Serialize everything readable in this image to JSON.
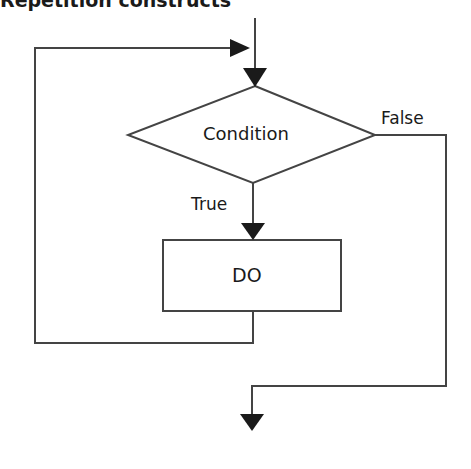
{
  "title": "Repetition constructs",
  "nodes": {
    "condition": {
      "label": "Condition",
      "shape": "diamond"
    },
    "do": {
      "label": "DO",
      "shape": "rectangle"
    }
  },
  "edges": {
    "true_label": "True",
    "false_label": "False"
  },
  "colors": {
    "line": "#444444",
    "arrow": "#1a1a1a",
    "text": "#1a1a1a",
    "background": "#ffffff"
  }
}
